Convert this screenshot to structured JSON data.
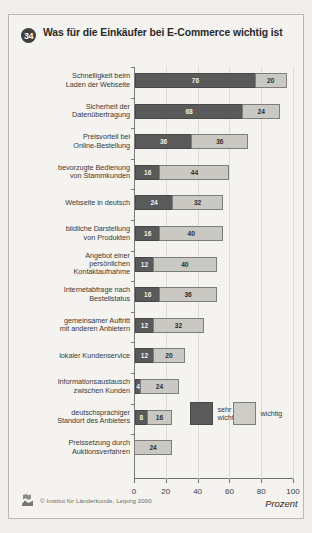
{
  "figure": {
    "number": "34",
    "title": "Was für die Einkäufer bei E-Commerce wichtig ist",
    "credit": "© Institut für Länderkunde, Leipzig 2000",
    "logo_icon": "institut-fuer-laenderkunde-logo"
  },
  "chart_data": {
    "type": "bar",
    "orientation": "horizontal",
    "stacked": true,
    "title": "Was für die Einkäufer bei E-Commerce wichtig ist",
    "xlabel": "Prozent",
    "ylabel": "",
    "xlim": [
      0,
      100
    ],
    "xticks": [
      0,
      20,
      40,
      60,
      80,
      100
    ],
    "xticklabels": [
      "0",
      "20",
      "40",
      "60",
      "80",
      "100"
    ],
    "grid": true,
    "legend_position": "inside-lower-right",
    "categories": [
      "Schnelligkeit beim Laden der Webseite",
      "Sicherheit der Datenübertragung",
      "Preisvorteil bei Online-Bestellung",
      "bevorzugte Bedienung von Stammkunden",
      "Webseite in deutsch",
      "bildliche Darstellung von Produkten",
      "Angebot einer persönlichen Kontaktaufnahme",
      "Internetabfrage nach Bestellstatus",
      "gemeinsamer Auftritt mit anderen Anbietern",
      "lokaler Kundenservice",
      "Informationsaustausch zwischen Kunden",
      "deutschsprachiger Standort des Anbieters",
      "Preissetzung durch Auktionsverfahren"
    ],
    "category_lines": [
      [
        "Schnelligkeit beim",
        "Laden der Webseite"
      ],
      [
        "Sicherheit der",
        "Datenübertragung"
      ],
      [
        "Preisvorteil bei",
        "Online-Bestellung"
      ],
      [
        "bevorzugte Bedienung",
        "von Stammkunden"
      ],
      [
        "Webseite in deutsch"
      ],
      [
        "bildliche Darstellung",
        "von Produkten"
      ],
      [
        "Angebot einer",
        "persönlichen",
        "Kontaktaufnahme"
      ],
      [
        "Internetabfrage nach",
        "Bestellstatus"
      ],
      [
        "gemeinsamer Auftritt",
        "mit anderen Anbietern"
      ],
      [
        "lokaler Kundenservice"
      ],
      [
        "Informationsaustausch",
        "zwischen Kunden"
      ],
      [
        "deutschsprachiger",
        "Standort des Anbieters"
      ],
      [
        "Preissetzung durch",
        "Auktionsverfahren"
      ]
    ],
    "series": [
      {
        "name": "sehr wichtig",
        "color": "#5a5a5a",
        "values": [
          76,
          68,
          36,
          16,
          24,
          16,
          12,
          16,
          12,
          12,
          4,
          8,
          0
        ]
      },
      {
        "name": "wichtig",
        "color": "#c9c8c3",
        "values": [
          20,
          24,
          36,
          44,
          32,
          40,
          40,
          36,
          32,
          20,
          24,
          16,
          24
        ]
      }
    ],
    "totals": [
      96,
      92,
      72,
      60,
      56,
      56,
      52,
      52,
      44,
      32,
      28,
      24,
      24
    ]
  }
}
